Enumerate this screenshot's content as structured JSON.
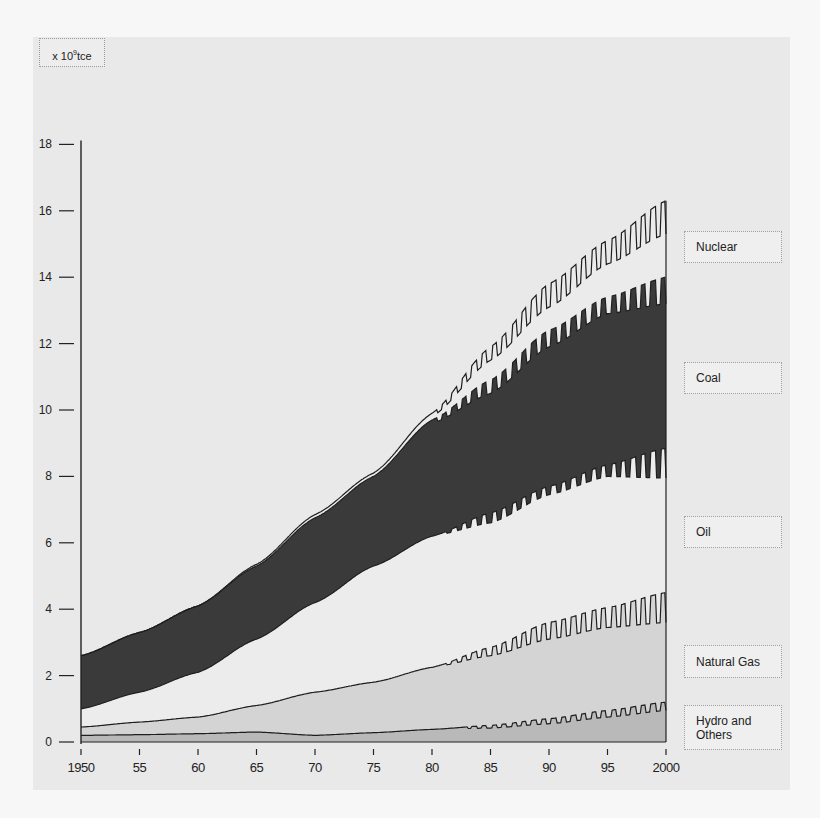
{
  "chart_data": {
    "type": "area",
    "title": "",
    "ylabel": "x 10^9 tce",
    "unit_label": {
      "prefix": "x 10",
      "exp": "9",
      "suffix": "tce"
    },
    "xlabel": "",
    "xlim": [
      1950,
      2000
    ],
    "ylim": [
      0,
      18
    ],
    "x_ticks": [
      1950,
      1955,
      1960,
      1965,
      1970,
      1975,
      1980,
      1985,
      1990,
      1995,
      2000
    ],
    "x_tick_labels": [
      "1950",
      "55",
      "60",
      "65",
      "70",
      "75",
      "80",
      "85",
      "90",
      "95",
      "2000"
    ],
    "y_ticks": [
      0,
      2,
      4,
      6,
      8,
      10,
      12,
      14,
      16,
      18
    ],
    "y_tick_labels": [
      "0",
      "2",
      "4",
      "6",
      "8",
      "10",
      "12",
      "14",
      "16",
      "18"
    ],
    "grid": false,
    "stacked": true,
    "projection_start_year": 1980,
    "note": "Values are cumulative (stacked) boundary heights; after 1980 each boundary is a projected range [low, high] drawn as a hatched band.",
    "x": [
      1950,
      1955,
      1960,
      1965,
      1970,
      1975,
      1980,
      1985,
      1990,
      1995,
      2000
    ],
    "series": [
      {
        "name": "Hydro and Others",
        "fill": "#b9b9b9",
        "top_high": [
          0.2,
          0.22,
          0.25,
          0.3,
          0.2,
          0.28,
          0.38,
          0.5,
          0.7,
          0.95,
          1.2
        ],
        "top_low": [
          0.2,
          0.22,
          0.25,
          0.3,
          0.2,
          0.28,
          0.38,
          0.42,
          0.55,
          0.75,
          0.95
        ]
      },
      {
        "name": "Natural Gas",
        "fill": "#d4d4d4",
        "top_high": [
          0.45,
          0.6,
          0.75,
          1.1,
          1.5,
          1.8,
          2.25,
          2.85,
          3.6,
          4.05,
          4.5
        ],
        "top_low": [
          0.45,
          0.6,
          0.75,
          1.1,
          1.5,
          1.8,
          2.25,
          2.6,
          3.1,
          3.45,
          3.6
        ]
      },
      {
        "name": "Oil",
        "fill": "#ececec",
        "top_high": [
          1.0,
          1.5,
          2.1,
          3.1,
          4.2,
          5.3,
          6.2,
          6.9,
          7.7,
          8.35,
          8.85
        ],
        "top_low": [
          1.0,
          1.5,
          2.1,
          3.1,
          4.2,
          5.3,
          6.2,
          6.6,
          7.45,
          8.0,
          7.95
        ]
      },
      {
        "name": "Coal",
        "fill": "#3a3a3a",
        "top_high": [
          2.6,
          3.3,
          4.1,
          5.3,
          6.75,
          8.0,
          9.7,
          10.9,
          12.4,
          13.4,
          14.0
        ],
        "top_low": [
          2.6,
          3.3,
          4.1,
          5.3,
          6.75,
          8.0,
          9.6,
          10.5,
          11.9,
          12.9,
          13.2
        ]
      },
      {
        "name": "Nuclear",
        "fill": "#ebebeb",
        "top_high": [
          2.6,
          3.3,
          4.1,
          5.35,
          6.85,
          8.1,
          9.9,
          11.9,
          13.8,
          15.1,
          16.3
        ],
        "top_low": [
          2.6,
          3.3,
          4.1,
          5.35,
          6.85,
          8.1,
          9.8,
          11.5,
          13.1,
          14.4,
          15.3
        ]
      }
    ],
    "legend": [
      "Nuclear",
      "Coal",
      "Oil",
      "Natural Gas",
      "Hydro and Others"
    ],
    "legend_position": "right"
  },
  "legend_labels": {
    "nuclear": "Nuclear",
    "coal": "Coal",
    "oil": "Oil",
    "gas": "Natural Gas",
    "hydro_line1": "Hydro and",
    "hydro_line2": "Others"
  },
  "unit": {
    "prefix": "x 10",
    "exp": "9",
    "suffix": "tce"
  }
}
